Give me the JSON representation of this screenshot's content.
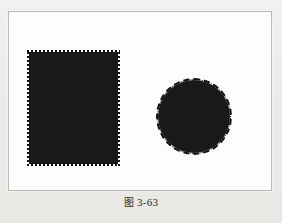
{
  "page": {
    "background_color": "#eeedeb",
    "panel_background_color": "#ffffff",
    "panel_border_color": "#b9b9b6"
  },
  "figure": {
    "shapes": [
      {
        "id": "rectangle",
        "name": "filled-rectangle",
        "selection_style": "marching-ants-dashed",
        "fill_color": "#191919",
        "border_color": "#111111"
      },
      {
        "id": "circle",
        "name": "filled-circle",
        "selection_style": "marching-ants-dashed",
        "fill_color": "#191919",
        "border_color": "#111111"
      }
    ]
  },
  "caption": {
    "label": "图",
    "number": "3-63",
    "full": "图 3-63"
  }
}
